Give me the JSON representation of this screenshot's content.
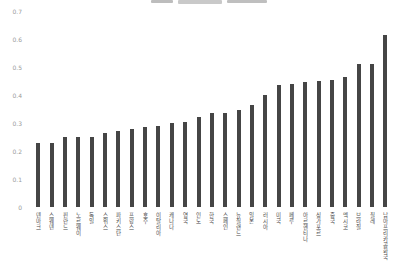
{
  "chart_data": {
    "type": "bar",
    "title": "",
    "title_clipped": true,
    "categories": [
      "덴마크",
      "스웨덴",
      "핀란드",
      "노르웨이",
      "독일",
      "스위스",
      "파키스탄",
      "프랑스",
      "호주",
      "이탈리아",
      "캐나다",
      "영국",
      "인도",
      "한국",
      "스페인",
      "뉴질랜드",
      "일본",
      "러시아",
      "미국",
      "페루",
      "아르헨티나",
      "싱가포르",
      "중국",
      "멕시코",
      "브라질",
      "칠레",
      "남아프리카공화국"
    ],
    "values": [
      0.23,
      0.23,
      0.25,
      0.25,
      0.25,
      0.265,
      0.27,
      0.28,
      0.285,
      0.29,
      0.3,
      0.305,
      0.32,
      0.335,
      0.335,
      0.345,
      0.365,
      0.4,
      0.435,
      0.44,
      0.445,
      0.45,
      0.455,
      0.465,
      0.51,
      0.51,
      0.615
    ],
    "xlabel": "",
    "ylabel": "",
    "ylim": [
      0,
      0.7
    ],
    "ytick_labels": [
      "0",
      "0.1",
      "0.2",
      "0.3",
      "0.4",
      "0.5",
      "0.6",
      "0.7"
    ],
    "grid": false,
    "legend_position": "none",
    "bar_color": "#454545",
    "ytick_color": "#9a9a9a",
    "category_label_color": "#4a4a4a",
    "background_color": "#ffffff"
  }
}
